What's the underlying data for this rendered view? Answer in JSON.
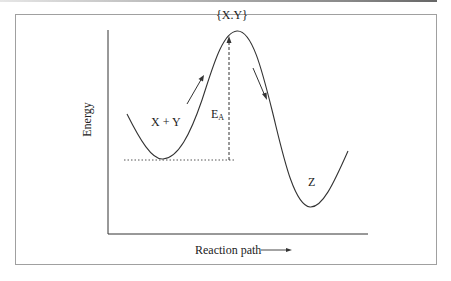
{
  "diagram": {
    "type": "reaction-energy-profile",
    "y_axis_label": "Energy",
    "x_axis_label": "Reaction path",
    "x_axis_arrow": "→",
    "labels": {
      "reactants": "X + Y",
      "transition_state": "{X.Y}",
      "product": "Z",
      "activation_energy_main": "E",
      "activation_energy_sub": "A"
    },
    "colors": {
      "curve": "#333333",
      "axes": "#333333",
      "frame": "#a0a0a0",
      "guide_lines": "#555555"
    }
  }
}
